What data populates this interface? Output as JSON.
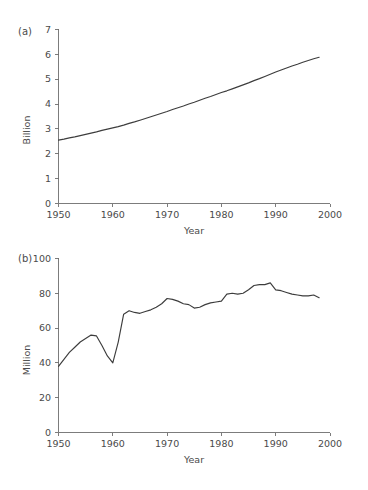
{
  "figure": {
    "background_color": "#ffffff",
    "line_color": "#3d3d3d",
    "axis_color": "#6e6e6e",
    "text_color": "#4a4a4a"
  },
  "panels": [
    {
      "tag": "(a)",
      "ylabel": "Billion",
      "xlabel": "Year",
      "xticks": [
        "1950",
        "1960",
        "1970",
        "1980",
        "1990",
        "2000"
      ],
      "yticks": [
        "0",
        "1",
        "2",
        "3",
        "4",
        "5",
        "6",
        "7"
      ]
    },
    {
      "tag": "(b)",
      "ylabel": "Million",
      "xlabel": "Year",
      "xticks": [
        "1950",
        "1960",
        "1970",
        "1980",
        "1990",
        "2000"
      ],
      "yticks": [
        "0",
        "20",
        "40",
        "60",
        "80",
        "100"
      ]
    }
  ],
  "chart_data": [
    {
      "type": "line",
      "title": "(a)",
      "xlabel": "Year",
      "ylabel": "Billion",
      "xlim": [
        1950,
        2000
      ],
      "ylim": [
        0,
        7
      ],
      "grid": false,
      "legend": null,
      "x": [
        1950,
        1951,
        1952,
        1953,
        1954,
        1955,
        1956,
        1957,
        1958,
        1959,
        1960,
        1961,
        1962,
        1963,
        1964,
        1965,
        1966,
        1967,
        1968,
        1969,
        1970,
        1971,
        1972,
        1973,
        1974,
        1975,
        1976,
        1977,
        1978,
        1979,
        1980,
        1981,
        1982,
        1983,
        1984,
        1985,
        1986,
        1987,
        1988,
        1989,
        1990,
        1991,
        1992,
        1993,
        1994,
        1995,
        1996,
        1997,
        1998
      ],
      "values": [
        2.55,
        2.59,
        2.64,
        2.68,
        2.73,
        2.78,
        2.83,
        2.88,
        2.94,
        2.99,
        3.04,
        3.09,
        3.15,
        3.22,
        3.28,
        3.35,
        3.42,
        3.49,
        3.56,
        3.63,
        3.7,
        3.78,
        3.85,
        3.92,
        4.0,
        4.07,
        4.15,
        4.23,
        4.3,
        4.38,
        4.46,
        4.53,
        4.61,
        4.69,
        4.77,
        4.85,
        4.94,
        5.02,
        5.11,
        5.2,
        5.29,
        5.37,
        5.45,
        5.53,
        5.6,
        5.68,
        5.75,
        5.82,
        5.88
      ],
      "ylabel_unit": "Billion",
      "series_name": "World population"
    },
    {
      "type": "line",
      "title": "(b)",
      "xlabel": "Year",
      "ylabel": "Million",
      "xlim": [
        1950,
        2000
      ],
      "ylim": [
        0,
        100
      ],
      "grid": false,
      "legend": null,
      "x": [
        1950,
        1951,
        1952,
        1953,
        1954,
        1955,
        1956,
        1957,
        1958,
        1959,
        1960,
        1961,
        1962,
        1963,
        1964,
        1965,
        1966,
        1967,
        1968,
        1969,
        1970,
        1971,
        1972,
        1973,
        1974,
        1975,
        1976,
        1977,
        1978,
        1979,
        1980,
        1981,
        1982,
        1983,
        1984,
        1985,
        1986,
        1987,
        1988,
        1989,
        1990,
        1991,
        1992,
        1993,
        1994,
        1995,
        1996,
        1997,
        1998
      ],
      "values": [
        38,
        42,
        46,
        49,
        52,
        54,
        56,
        55.5,
        50,
        44,
        40,
        52,
        68,
        70,
        69,
        68.5,
        69.5,
        70.5,
        72,
        74,
        77,
        76.5,
        75.5,
        74,
        73.5,
        71.5,
        72,
        73.5,
        74.5,
        75,
        75.5,
        79.5,
        80,
        79.5,
        80,
        82,
        84.5,
        85,
        85,
        86,
        82,
        81.5,
        80.5,
        79.5,
        79,
        78.5,
        78.5,
        79,
        77.5
      ],
      "ylabel_unit": "Million",
      "series_name": "Annual population increase"
    }
  ]
}
